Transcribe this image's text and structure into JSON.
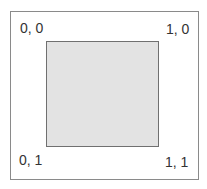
{
  "diagram": {
    "corners": {
      "top_left": "0, 0",
      "top_right": "1, 0",
      "bottom_left": "0, 1",
      "bottom_right": "1, 1"
    },
    "colors": {
      "inner_fill": "#e3e3e3",
      "outer_border": "#8a8a8a"
    }
  }
}
